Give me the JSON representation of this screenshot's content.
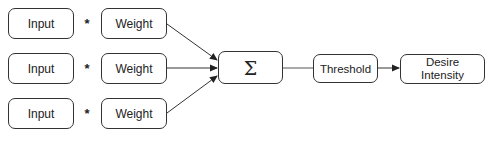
{
  "diagram": {
    "rows": [
      {
        "input": "Input",
        "operator": "*",
        "weight": "Weight"
      },
      {
        "input": "Input",
        "operator": "*",
        "weight": "Weight"
      },
      {
        "input": "Input",
        "operator": "*",
        "weight": "Weight"
      }
    ],
    "sum_node": {
      "label": "Σ"
    },
    "threshold_node": {
      "label": "Threshold"
    },
    "output_node": {
      "label_line1": "Desire",
      "label_line2": "Intensity"
    },
    "colors": {
      "stroke": "#333333",
      "background": "#ffffff",
      "text": "#222222"
    }
  }
}
